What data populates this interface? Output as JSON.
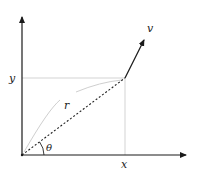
{
  "diagram": {
    "title": "",
    "labels": {
      "x": "x",
      "y": "y",
      "r": "r",
      "theta": "θ",
      "v": "v"
    },
    "colors": {
      "axis": "#1a1a1a",
      "guide": "#c8c8c8",
      "radius_dashed": "#222222",
      "arc": "#cfcfcf",
      "vector": "#1a1a1a"
    },
    "elements": {
      "origin": [
        22,
        155
      ],
      "point": [
        125,
        78
      ],
      "x_axis_end": [
        188,
        155
      ],
      "y_axis_end": [
        22,
        15
      ],
      "vector_tip": [
        146,
        36
      ]
    }
  }
}
